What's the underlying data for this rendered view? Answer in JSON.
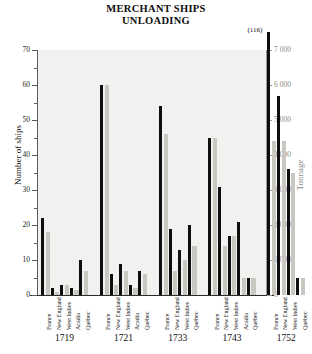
{
  "title": {
    "line1": "MERCHANT SHIPS",
    "line2": "UNLOADING"
  },
  "axes": {
    "left_label": "Number of ships",
    "right_label": "Tonnage",
    "left_ticks": [
      "0",
      "10",
      "20",
      "30",
      "40",
      "50",
      "60",
      "70"
    ],
    "right_ticks": [
      "0",
      "1 000",
      "2 000",
      "3 000",
      "4 000",
      "5 000",
      "6 000",
      "7 000"
    ]
  },
  "annotations": [
    {
      "text": "(116)",
      "group": "1752",
      "category": "France",
      "series": "ships"
    }
  ],
  "colors": {
    "ships_bar": "#0e0e0e",
    "tonnage_bar": "#c9c7c2",
    "plot_background": "#f2f1ef",
    "left_axis_text": "#1d1d1d",
    "right_axis_text": "#8d8b86"
  },
  "chart_data": {
    "type": "bar",
    "title": "MERCHANT SHIPS UNLOADING",
    "xlabel": "",
    "ylabel": "Number of ships",
    "y2label": "Tonnage",
    "ylim": [
      0,
      70
    ],
    "y2lim": [
      0,
      7000
    ],
    "grid": false,
    "legend": "none",
    "series": [
      {
        "name": "Number of ships",
        "axis": "left",
        "color": "#0e0e0e"
      },
      {
        "name": "Tonnage",
        "axis": "right",
        "color": "#c9c7c2"
      }
    ],
    "groups": [
      {
        "year": "1719",
        "categories": [
          "France",
          "New England",
          "West Indies",
          "Acadia",
          "Québec"
        ],
        "ships": [
          22,
          2,
          3,
          2,
          10
        ],
        "tonnage": [
          1800,
          100,
          300,
          150,
          700
        ]
      },
      {
        "year": "1721",
        "categories": [
          "France",
          "New England",
          "West Indies",
          "Acadia",
          "Québec"
        ],
        "ships": [
          60,
          6,
          9,
          3,
          7
        ],
        "tonnage": [
          6000,
          300,
          700,
          200,
          600
        ]
      },
      {
        "year": "1733",
        "categories": [
          "France",
          "New England",
          "West Indies",
          "Québec"
        ],
        "ships": [
          54,
          19,
          13,
          20
        ],
        "tonnage": [
          4600,
          700,
          1000,
          1400
        ]
      },
      {
        "year": "1743",
        "categories": [
          "France",
          "New England",
          "West Indies",
          "Acadia",
          "Québec"
        ],
        "ships": [
          45,
          31,
          17,
          21,
          5
        ],
        "tonnage": [
          4500,
          1400,
          1700,
          500,
          500
        ]
      },
      {
        "year": "1752",
        "categories": [
          "France",
          "New England",
          "West Indies",
          "Québec"
        ],
        "ships": [
          116,
          57,
          36,
          5
        ],
        "tonnage": [
          4400,
          4400,
          3500,
          500
        ]
      }
    ]
  }
}
